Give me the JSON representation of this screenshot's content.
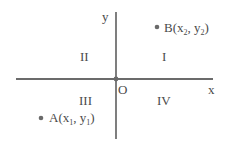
{
  "diagram": {
    "type": "cartesian-plane-quadrants",
    "axes": {
      "x_label": "x",
      "y_label": "y",
      "origin_label": "O"
    },
    "quadrants": [
      {
        "label": "I",
        "position": "upper-right"
      },
      {
        "label": "II",
        "position": "upper-left"
      },
      {
        "label": "III",
        "position": "lower-left"
      },
      {
        "label": "IV",
        "position": "lower-right"
      }
    ],
    "points": [
      {
        "name": "B",
        "x_var": "x",
        "x_sub": "2",
        "y_var": "y",
        "y_sub": "2",
        "quadrant": "I"
      },
      {
        "name": "A",
        "x_var": "x",
        "x_sub": "1",
        "y_var": "y",
        "y_sub": "1",
        "quadrant": "III"
      }
    ],
    "colors": {
      "line": "#3a3a3a",
      "text": "#4a4a4a",
      "point": "#6a6a6a",
      "background": "#ffffff"
    }
  }
}
